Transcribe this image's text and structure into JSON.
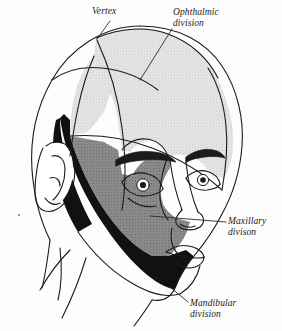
{
  "figure": {
    "view": "right anterolateral oblique"
  },
  "labels": {
    "vertex": {
      "text": "Vertex",
      "line1": "Vertex",
      "line2": "",
      "style": "italic"
    },
    "ophthalmic": {
      "text": "Ophthalmic division",
      "line1": "Ophthalmic",
      "line2": "division",
      "style": "italic"
    },
    "maxillary": {
      "text": "Maxillary divison",
      "line1": "Maxillary",
      "line2": "divison",
      "style": "italic"
    },
    "mandibular": {
      "text": "Mandibular division",
      "line1": "Mandibular",
      "line2": "division",
      "style": "italic"
    }
  },
  "regions": [
    {
      "name": "ophthalmic-region",
      "label": "Ophthalmic division",
      "fill": "#d8d8d8",
      "pattern": "fine stipple",
      "tone": "light gray"
    },
    {
      "name": "maxillary-region",
      "label": "Maxillary divison",
      "fill": "#8a8a8a",
      "pattern": "medium stipple",
      "tone": "medium gray"
    },
    {
      "name": "mandibular-region",
      "label": "Mandibular division",
      "fill": "#111111",
      "pattern": "solid",
      "tone": "black"
    }
  ],
  "colors": {
    "ink": "#1b1b1b",
    "background": "#fdfdfd",
    "ophthalmic_fill": "#d8d8d8",
    "maxillary_fill": "#8a8a8a",
    "mandibular_fill": "#111111",
    "leader_line": "#2a2a2a"
  },
  "anatomy": {
    "features": [
      "head outline",
      "ear",
      "left eye",
      "right eye",
      "eyebrow",
      "nose",
      "lips",
      "chin",
      "neck"
    ]
  }
}
